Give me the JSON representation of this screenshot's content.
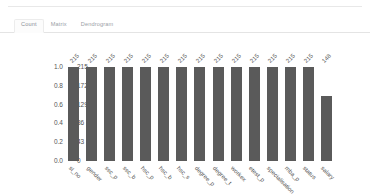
{
  "panel": {
    "tabs": [
      {
        "id": "count",
        "label": "Count",
        "active": true
      },
      {
        "id": "matrix",
        "label": "Matrix",
        "active": false
      },
      {
        "id": "dendrogram",
        "label": "Dendrogram",
        "active": false
      }
    ]
  },
  "chart_data": {
    "type": "bar",
    "title": "",
    "xlabel": "",
    "ylabel": "",
    "grid": false,
    "legend": null,
    "bar_color": "#5a5a5a",
    "total_rows": 215,
    "categories": [
      "sl_no",
      "gender",
      "ssc_p",
      "ssc_b",
      "hsc_p",
      "hsc_b",
      "hsc_s",
      "degree_p",
      "degree_t",
      "workex",
      "etest_p",
      "specialisation",
      "mba_p",
      "status",
      "salary"
    ],
    "values": [
      215,
      215,
      215,
      215,
      215,
      215,
      215,
      215,
      215,
      215,
      215,
      215,
      215,
      215,
      148
    ],
    "fractions": [
      1.0,
      1.0,
      1.0,
      1.0,
      1.0,
      1.0,
      1.0,
      1.0,
      1.0,
      1.0,
      1.0,
      1.0,
      1.0,
      1.0,
      0.688
    ],
    "bar_labels": [
      "215",
      "215",
      "215",
      "215",
      "215",
      "215",
      "215",
      "215",
      "215",
      "215",
      "215",
      "215",
      "215",
      "215",
      "148"
    ],
    "yaxis_left": {
      "ticks": [
        "1.0",
        "0.8",
        "0.6",
        "0.4",
        "0.2",
        "0.0"
      ],
      "positions": [
        1.0,
        0.8,
        0.6,
        0.4,
        0.2,
        0.0
      ],
      "ylim": [
        0,
        1
      ]
    },
    "yaxis_right": {
      "ticks": [
        "215",
        "172",
        "129",
        "86",
        "43",
        "0"
      ],
      "positions": [
        1.0,
        0.8,
        0.6,
        0.4,
        0.2,
        0.0
      ],
      "ylim": [
        0,
        215
      ]
    }
  }
}
